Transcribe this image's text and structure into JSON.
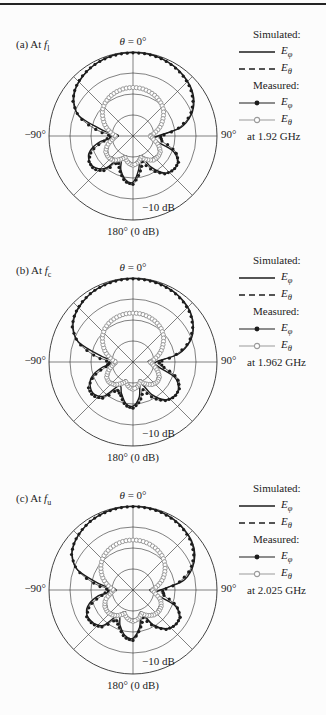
{
  "colors": {
    "ink": "#1c1c1c",
    "grid": "#2e2e2e",
    "measured_theta_gray": "#9a9a9a",
    "background": "#fcfcfc"
  },
  "legend": {
    "simulated_heading": "Simulated:",
    "measured_heading": "Measured:",
    "e_base": "E",
    "phi_sub": "φ",
    "theta_sub": "θ"
  },
  "polar_labels": {
    "top_theta": "θ",
    "top_rest": " = 0°",
    "right": "90°",
    "left": "−90°",
    "ring": "−10 dB",
    "bottom": "180° (0 dB)"
  },
  "chart_data": [
    {
      "type": "polar-line",
      "title": "(a) At fl — normalized radiation pattern at 1.92 GHz",
      "panel_prefix": "(a) At ",
      "panel_f": "f",
      "panel_fsub": "l",
      "freq_note": "at 1.92 GHz",
      "r_axis": {
        "unit": "dB",
        "outer_db": 0,
        "rings_db": [
          0,
          -10,
          -20,
          -30
        ],
        "center_db": -40
      },
      "theta_start": -180,
      "theta_step": 10,
      "series": [
        {
          "name": "Simulated E_phi",
          "style": "solid",
          "color": "#1c1c1c",
          "dB": [
            -18,
            -19,
            -23,
            -28,
            -20,
            -16.5,
            -16,
            -18,
            -24,
            -33,
            -26,
            -13,
            -7.5,
            -4.5,
            -2.8,
            -1.6,
            -0.8,
            -0.3,
            -0.2,
            -0.3,
            -0.7,
            -1.4,
            -2.5,
            -4,
            -6.5,
            -10.5,
            -17,
            -28,
            -30,
            -20,
            -15.5,
            -15,
            -17,
            -23,
            -30,
            -24,
            -18
          ]
        },
        {
          "name": "Simulated E_theta",
          "style": "dashed",
          "color": "#1c1c1c",
          "dB": [
            -27,
            -28,
            -30,
            -28,
            -26,
            -25.5,
            -26,
            -28,
            -31,
            -33,
            -30,
            -27,
            -24,
            -21.5,
            -19.8,
            -18.6,
            -17.8,
            -17.3,
            -17.2,
            -17.3,
            -17.8,
            -18.6,
            -19.8,
            -21.5,
            -24,
            -27,
            -30,
            -33,
            -31,
            -28,
            -26,
            -25.5,
            -26,
            -28,
            -30,
            -28,
            -27
          ]
        },
        {
          "name": "Measured E_phi",
          "style": "dots-filled",
          "color": "#1c1c1c",
          "dB": [
            -17,
            -18,
            -22,
            -26,
            -18.5,
            -15.5,
            -15.8,
            -19,
            -26,
            -30,
            -22,
            -12.5,
            -7,
            -4.2,
            -2.6,
            -1.5,
            -0.9,
            -0.5,
            -0.4,
            -0.4,
            -0.8,
            -1.6,
            -2.8,
            -4.4,
            -7,
            -11,
            -18,
            -27,
            -26,
            -18.5,
            -15,
            -14.8,
            -16.5,
            -21,
            -27,
            -22,
            -17
          ]
        },
        {
          "name": "Measured E_theta",
          "style": "dots-open",
          "color": "#9a9a9a",
          "dB": [
            -26,
            -27,
            -29,
            -27,
            -25,
            -24.5,
            -25,
            -27,
            -30,
            -32,
            -29,
            -26,
            -23.5,
            -21,
            -19.4,
            -18.2,
            -17.5,
            -17,
            -16.9,
            -17,
            -17.5,
            -18.2,
            -19.4,
            -21,
            -23.5,
            -26,
            -29,
            -32,
            -30,
            -27,
            -25,
            -24.5,
            -25,
            -27,
            -29,
            -27,
            -26
          ]
        }
      ]
    },
    {
      "type": "polar-line",
      "title": "(b) At fc — normalized radiation pattern at 1.962 GHz",
      "panel_prefix": "(b) At ",
      "panel_f": "f",
      "panel_fsub": "c",
      "freq_note": "at 1.962 GHz",
      "r_axis": {
        "unit": "dB",
        "outer_db": 0,
        "rings_db": [
          0,
          -10,
          -20,
          -30
        ],
        "center_db": -40
      },
      "theta_start": -180,
      "theta_step": 10,
      "series": [
        {
          "name": "Simulated E_phi",
          "style": "solid",
          "color": "#1c1c1c",
          "dB": [
            -19,
            -20,
            -24,
            -27,
            -19,
            -16,
            -16.5,
            -19,
            -25,
            -32,
            -25,
            -12.5,
            -7,
            -4.3,
            -2.7,
            -1.5,
            -0.8,
            -0.3,
            -0.2,
            -0.3,
            -0.7,
            -1.3,
            -2.4,
            -4,
            -6.8,
            -11,
            -18,
            -29,
            -28,
            -19,
            -15,
            -14.5,
            -16.5,
            -22,
            -29,
            -23,
            -19
          ]
        },
        {
          "name": "Simulated E_theta",
          "style": "dashed",
          "color": "#1c1c1c",
          "dB": [
            -28,
            -29,
            -31,
            -29,
            -27,
            -26,
            -26.5,
            -28.5,
            -31,
            -33,
            -30,
            -27,
            -24,
            -21.5,
            -19.6,
            -18.4,
            -17.6,
            -17.1,
            -17,
            -17.1,
            -17.6,
            -18.4,
            -19.6,
            -21.5,
            -24,
            -27,
            -30,
            -33,
            -31,
            -28.5,
            -26.5,
            -26,
            -27,
            -29,
            -31,
            -29,
            -28
          ]
        },
        {
          "name": "Measured E_phi",
          "style": "dots-filled",
          "color": "#1c1c1c",
          "dB": [
            -18,
            -19,
            -23,
            -25,
            -17.5,
            -15,
            -15.5,
            -20,
            -27,
            -29,
            -21,
            -12,
            -6.6,
            -4,
            -2.5,
            -1.4,
            -0.9,
            -0.5,
            -0.4,
            -0.5,
            -0.9,
            -1.5,
            -2.7,
            -4.3,
            -7.2,
            -11.5,
            -19,
            -28,
            -25,
            -17.5,
            -14.5,
            -14.2,
            -16,
            -20,
            -26,
            -21,
            -18
          ]
        },
        {
          "name": "Measured E_theta",
          "style": "dots-open",
          "color": "#9a9a9a",
          "dB": [
            -27,
            -28,
            -30,
            -28,
            -26,
            -25,
            -25.5,
            -27.5,
            -30,
            -32,
            -29,
            -26,
            -23.5,
            -21,
            -19.2,
            -18,
            -17.3,
            -16.8,
            -16.7,
            -16.8,
            -17.3,
            -18,
            -19.2,
            -21,
            -23.5,
            -26,
            -29,
            -32,
            -30,
            -27.5,
            -25.5,
            -25,
            -26,
            -28,
            -30,
            -28,
            -27
          ]
        }
      ]
    },
    {
      "type": "polar-line",
      "title": "(c) At fu — normalized radiation pattern at 2.025 GHz",
      "panel_prefix": "(c) At ",
      "panel_f": "f",
      "panel_fsub": "u",
      "freq_note": "at 2.025 GHz",
      "r_axis": {
        "unit": "dB",
        "outer_db": 0,
        "rings_db": [
          0,
          -10,
          -20,
          -30
        ],
        "center_db": -40
      },
      "theta_start": -180,
      "theta_step": 10,
      "series": [
        {
          "name": "Simulated E_phi",
          "style": "solid",
          "color": "#1c1c1c",
          "dB": [
            -17,
            -18,
            -22,
            -26,
            -18,
            -15.5,
            -15,
            -17,
            -23,
            -31,
            -24,
            -12,
            -6.5,
            -4,
            -2.5,
            -1.4,
            -0.7,
            -0.3,
            -0.2,
            -0.3,
            -0.6,
            -1.2,
            -2.2,
            -3.6,
            -6,
            -10,
            -16,
            -27,
            -29,
            -19,
            -14.5,
            -14,
            -16,
            -21,
            -28,
            -22,
            -17
          ]
        },
        {
          "name": "Simulated E_theta",
          "style": "dashed",
          "color": "#1c1c1c",
          "dB": [
            -26,
            -27,
            -29,
            -27,
            -25.5,
            -25,
            -25.5,
            -27,
            -30,
            -32,
            -29,
            -26,
            -23,
            -20.8,
            -19,
            -17.9,
            -17.1,
            -16.6,
            -16.5,
            -16.6,
            -17.1,
            -17.9,
            -19,
            -20.8,
            -23,
            -26,
            -29,
            -32,
            -30,
            -27,
            -25.5,
            -25,
            -25.5,
            -27,
            -29,
            -27,
            -26
          ]
        },
        {
          "name": "Measured E_phi",
          "style": "dots-filled",
          "color": "#1c1c1c",
          "dB": [
            -16,
            -17,
            -21,
            -24,
            -17,
            -14.8,
            -14.5,
            -18,
            -25,
            -29,
            -21,
            -11.5,
            -6.2,
            -3.8,
            -2.4,
            -1.3,
            -0.8,
            -0.4,
            -0.3,
            -0.4,
            -0.7,
            -1.4,
            -2.5,
            -4,
            -6.6,
            -10.8,
            -17.5,
            -26,
            -25,
            -18,
            -14,
            -13.8,
            -15.5,
            -20,
            -26,
            -21,
            -16
          ]
        },
        {
          "name": "Measured E_theta",
          "style": "dots-open",
          "color": "#9a9a9a",
          "dB": [
            -25,
            -26,
            -28,
            -26,
            -24.5,
            -24,
            -24.5,
            -26,
            -29,
            -31,
            -28,
            -25,
            -22.5,
            -20.2,
            -18.6,
            -17.5,
            -16.8,
            -16.3,
            -16.2,
            -16.3,
            -16.8,
            -17.5,
            -18.6,
            -20.2,
            -22.5,
            -25,
            -28,
            -31,
            -29,
            -26,
            -24.5,
            -24,
            -24.5,
            -26,
            -28,
            -26,
            -25
          ]
        }
      ]
    }
  ]
}
